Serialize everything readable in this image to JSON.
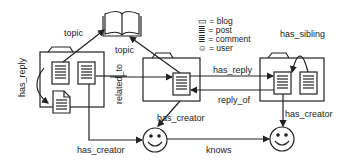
{
  "legend": {
    "blog": "▭ = blog",
    "post": "≣ = post",
    "comment": "≣ = comment",
    "user": "☺ = user"
  },
  "edges": {
    "topic_left": "topic",
    "topic_right": "topic",
    "has_reply_vertical": "has_reply",
    "related_to": "related_to",
    "has_reply_horizontal": "has_reply",
    "reply_of": "reply_of",
    "has_sibling": "has_sibling",
    "has_creator_mid": "has_creator",
    "has_creator_right": "has_creator",
    "has_creator_bottom": "has_creator",
    "knows": "knows"
  },
  "colors": {
    "stroke": "#222222",
    "background": "#ffffff"
  }
}
